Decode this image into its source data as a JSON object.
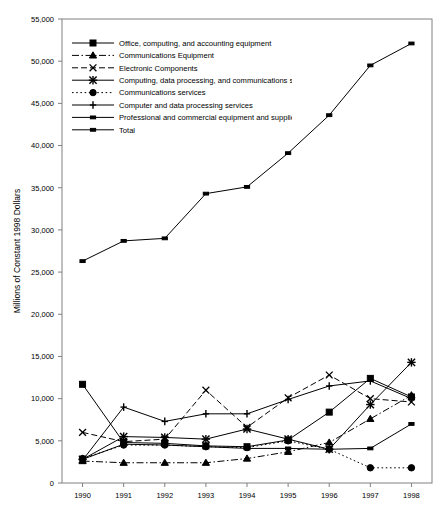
{
  "chart_data": {
    "type": "line",
    "title": "",
    "xlabel": "",
    "ylabel": "Millions of Constant 1998 Dollars",
    "x": [
      1990,
      1991,
      1992,
      1993,
      1994,
      1995,
      1996,
      1997,
      1998
    ],
    "categories": [
      "1990",
      "1991",
      "1992",
      "1993",
      "1994",
      "1995",
      "1996",
      "1997",
      "1998"
    ],
    "ylim": [
      0,
      55000
    ],
    "ytick_values": [
      0,
      5000,
      10000,
      15000,
      20000,
      25000,
      30000,
      35000,
      40000,
      45000,
      50000,
      55000
    ],
    "ytick_labels": [
      "0",
      "5,000",
      "10,000",
      "15,000",
      "20,000",
      "25,000",
      "30,000",
      "35,000",
      "40,000",
      "45,000",
      "50,000",
      "55,000"
    ],
    "grid": false,
    "legend_position": "top-left",
    "series": [
      {
        "name": "Office, computing, and accounting equipment",
        "marker": "square",
        "dash": "solid",
        "values": [
          11700,
          4800,
          4700,
          4400,
          4300,
          5100,
          8400,
          12400,
          10200
        ]
      },
      {
        "name": "Communications Equipment",
        "marker": "triangle",
        "dash": "dashdot",
        "values": [
          2600,
          2400,
          2400,
          2400,
          2900,
          3700,
          4800,
          7600,
          10400
        ]
      },
      {
        "name": "Electronic Components",
        "marker": "cross",
        "dash": "dashed",
        "values": [
          6000,
          4900,
          5200,
          11000,
          6600,
          10100,
          12800,
          10000,
          9600
        ]
      },
      {
        "name": "Computing, data processing, and communications services",
        "marker": "star",
        "dash": "solid",
        "values": [
          2800,
          5500,
          5400,
          5200,
          6400,
          5200,
          4000,
          9300,
          14300
        ]
      },
      {
        "name": "Communications services",
        "marker": "circle",
        "dash": "dotted",
        "values": [
          2900,
          4500,
          4500,
          4300,
          4200,
          5000,
          4000,
          1800,
          1800
        ]
      },
      {
        "name": "Computer and data processing services",
        "marker": "plus",
        "dash": "solid",
        "values": [
          2700,
          9000,
          7300,
          8200,
          8200,
          9900,
          11500,
          12100,
          10000
        ]
      },
      {
        "name": "Professional and commercial equipment and supplies",
        "marker": "dash",
        "dash": "solid",
        "values": [
          2800,
          4600,
          4500,
          4300,
          4100,
          4100,
          4000,
          4100,
          7000
        ]
      },
      {
        "name": "Total",
        "marker": "dash",
        "dash": "solid",
        "values": [
          26300,
          28700,
          29000,
          34300,
          35100,
          39100,
          43600,
          49500,
          52100
        ]
      }
    ]
  }
}
